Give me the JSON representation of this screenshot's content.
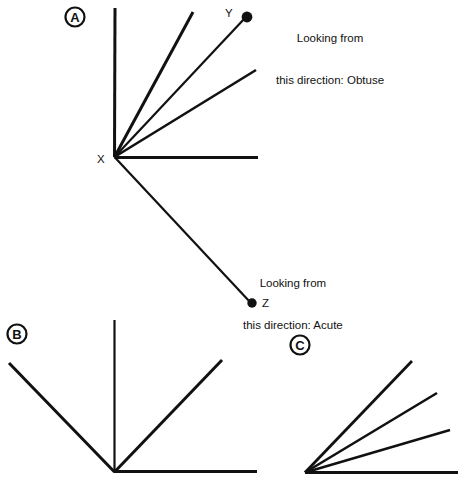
{
  "figure": {
    "background_color": "#ffffff",
    "stroke_color": "#111111",
    "panels": [
      {
        "id": "A",
        "label": "A",
        "label_center": [
          75,
          17
        ],
        "vertex": [
          114,
          157
        ],
        "vertex_label": "X",
        "vertex_label_pos": [
          100,
          160
        ],
        "rays": [
          {
            "name": "ray-vertical-up",
            "to": [
              115,
              8
            ],
            "width": 3.0
          },
          {
            "name": "ray-steep-diagonal",
            "to": [
              193,
              12
            ],
            "width": 3.0
          },
          {
            "name": "ray-to-y",
            "to": [
              245,
              18
            ],
            "width": 2.2
          },
          {
            "name": "ray-shallow-diagonal",
            "to": [
              256,
              70
            ],
            "width": 2.6
          },
          {
            "name": "ray-horizontal-right",
            "to": [
              258,
              157
            ],
            "width": 3.0
          },
          {
            "name": "ray-to-z",
            "to": [
              250,
              302
            ],
            "width": 2.2
          }
        ],
        "points": [
          {
            "name": "point-y",
            "label": "Y",
            "dot": [
              247,
              17
            ],
            "radius": 5.2,
            "label_pos": [
              227,
              13
            ]
          },
          {
            "name": "point-z",
            "label": "Z",
            "dot": [
              252,
              303
            ],
            "radius": 4.6,
            "label_pos": [
              262,
              306
            ]
          }
        ]
      },
      {
        "id": "B",
        "label": "B",
        "label_center": [
          17,
          334
        ],
        "vertex": [
          114,
          472
        ],
        "rays": [
          {
            "name": "ray-vertical-up",
            "to": [
              114,
              320
            ],
            "width": 2.2
          },
          {
            "name": "ray-horizontal-right",
            "to": [
              257,
              472
            ],
            "width": 3.0
          },
          {
            "name": "ray-upper-left",
            "to": [
              9,
              363
            ],
            "width": 3.0
          },
          {
            "name": "ray-upper-right",
            "to": [
              222,
              360
            ],
            "width": 3.0
          }
        ],
        "points": []
      },
      {
        "id": "C",
        "label": "C",
        "label_center": [
          300,
          345
        ],
        "vertex": [
          305,
          473
        ],
        "rays": [
          {
            "name": "ray-horizontal-right",
            "to": [
              458,
              473
            ],
            "width": 3.0
          },
          {
            "name": "ray-shallow",
            "to": [
              450,
              430
            ],
            "width": 2.4
          },
          {
            "name": "ray-middle",
            "to": [
              437,
              393
            ],
            "width": 2.6
          },
          {
            "name": "ray-steep",
            "to": [
              412,
              361
            ],
            "width": 2.8
          }
        ],
        "points": []
      }
    ]
  },
  "captions": {
    "obtuse": {
      "line1": "Looking from",
      "line2": "this direction: Obtuse"
    },
    "acute": {
      "line1": "Looking from",
      "line2": "this direction: Acute"
    }
  }
}
